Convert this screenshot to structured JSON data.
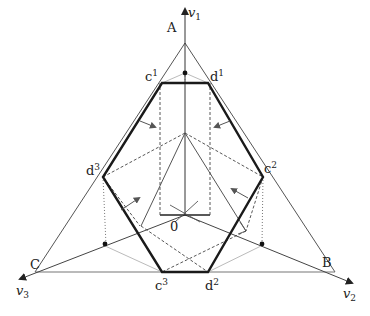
{
  "diagram": {
    "axes": {
      "v1": {
        "name": "v",
        "sub": "1"
      },
      "v2": {
        "name": "v",
        "sub": "2"
      },
      "v3": {
        "name": "v",
        "sub": "3"
      }
    },
    "vertices": {
      "A": "A",
      "B": "B",
      "C": "C"
    },
    "hexagon_points": {
      "c1": {
        "base": "c",
        "sup": "1"
      },
      "d1": {
        "base": "d",
        "sup": "1"
      },
      "c2": {
        "base": "c",
        "sup": "2"
      },
      "d2": {
        "base": "d",
        "sup": "2"
      },
      "c3": {
        "base": "c",
        "sup": "3"
      },
      "d3": {
        "base": "d",
        "sup": "3"
      }
    },
    "origin": "0",
    "colors": {
      "line": "#555555",
      "hexagon": "#1a1a1a",
      "dashed": "#444444",
      "dotted": "#666666",
      "light": "#bbbbbb"
    }
  }
}
